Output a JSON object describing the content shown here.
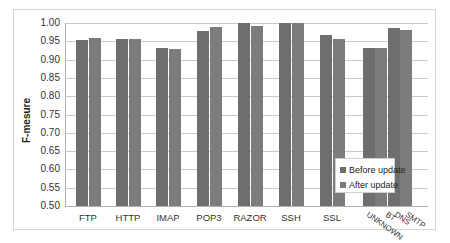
{
  "chart_data": {
    "type": "bar",
    "title": "",
    "xlabel": "",
    "ylabel": "F-mesure",
    "ylim": [
      0.5,
      1.0
    ],
    "yticks": [
      "1.00",
      "0.95",
      "0.90",
      "0.85",
      "0.80",
      "0.75",
      "0.70",
      "0.65",
      "0.60",
      "0.55",
      "0.50"
    ],
    "grid": true,
    "legend_position": "inside-bottom-right",
    "categories": [
      "FTP",
      "HTTP",
      "IMAP",
      "POP3",
      "RAZOR",
      "SSH",
      "SSL",
      "UNKNOWN",
      "BT DNS SMTP"
    ],
    "series": [
      {
        "name": "Before update",
        "color": "#6e6e6e",
        "values": [
          0.953,
          0.957,
          0.932,
          0.977,
          1.0,
          1.0,
          0.966,
          0.931,
          0.986
        ]
      },
      {
        "name": "After update",
        "color": "#7c7c7c",
        "values": [
          0.959,
          0.955,
          0.928,
          0.989,
          0.992,
          1.0,
          0.957,
          0.933,
          0.98
        ]
      }
    ],
    "rotated_tail_labels": [
      "UNKNOWN",
      "BT",
      "DNS",
      "SMTP"
    ]
  },
  "legend": {
    "items": [
      {
        "label": "Before update",
        "color": "#6e6e6e"
      },
      {
        "label": "After update",
        "color": "#7c7c7c"
      }
    ]
  }
}
